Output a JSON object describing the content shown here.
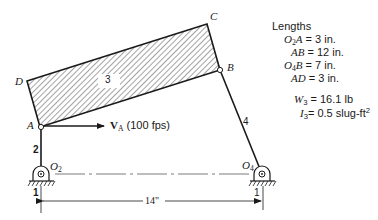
{
  "diagram": {
    "points": {
      "O2": {
        "label": "O",
        "sub": "2"
      },
      "O4": {
        "label": "O",
        "sub": "4"
      },
      "A": {
        "label": "A"
      },
      "B": {
        "label": "B"
      },
      "C": {
        "label": "C"
      },
      "D": {
        "label": "D"
      }
    },
    "links": {
      "ground1": "1",
      "ground2": "1",
      "crank": "2",
      "coupler": "3",
      "rocker": "4"
    },
    "velocity": {
      "symbol": "V",
      "sub": "A",
      "value": "(100 fps)"
    },
    "dimension": "14\""
  },
  "lengths": {
    "title": "Lengths",
    "rows": [
      {
        "lhs": "O",
        "lhs_sub": "2",
        "lhs_rest": "A",
        "value": " = 3 in."
      },
      {
        "lhs": "AB",
        "lhs_sub": "",
        "lhs_rest": "",
        "value": " = 12 in."
      },
      {
        "lhs": "O",
        "lhs_sub": "4",
        "lhs_rest": "B",
        "value": " = 7 in."
      },
      {
        "lhs": "AD",
        "lhs_sub": "",
        "lhs_rest": "",
        "value": " = 3 in."
      }
    ]
  },
  "properties": {
    "weight": {
      "sym": "W",
      "sub": "3",
      "value": " = 16.1 lb"
    },
    "inertia": {
      "sym": "I",
      "sub": "3",
      "value": "= 0.5 slug-ft",
      "sup": "2"
    }
  }
}
